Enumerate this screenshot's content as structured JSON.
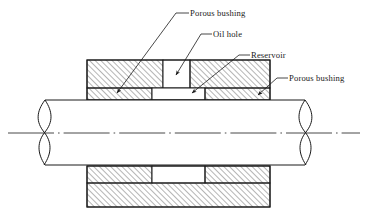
{
  "figure": {
    "type": "engineering-cross-section",
    "background_color": "#ffffff",
    "line_color": "#1a1a1a",
    "hatch_color": "#555555"
  },
  "labels": {
    "porous_bushing_top": "Porous bushing",
    "oil_hole": "Oil hole",
    "reservoir": "Reservoir",
    "porous_bushing_right": "Porous bushing"
  },
  "parts": {
    "shaft": "shaft",
    "upper_housing": "upper-housing",
    "lower_housing": "lower-housing",
    "oil_hole_cavity": "oil-hole-cavity",
    "reservoir_cavity": "reservoir-cavity",
    "bushing_upper_left": "bushing-upper-left",
    "bushing_upper_right": "bushing-upper-right",
    "bushing_lower_left": "bushing-lower-left",
    "bushing_lower_right": "bushing-lower-right",
    "centerline": "centerline"
  }
}
